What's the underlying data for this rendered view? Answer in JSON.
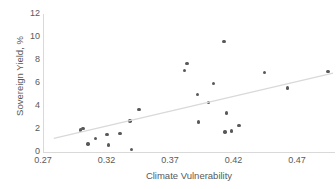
{
  "chart_data": {
    "type": "scatter",
    "title": "",
    "xlabel": "Climate Vulnerability",
    "ylabel": "Sovereign Yield, %",
    "xlim": [
      0.27,
      0.5
    ],
    "ylim": [
      0,
      12
    ],
    "xticks": [
      "0.27",
      "0.32",
      "0.37",
      "0.42",
      "0.47"
    ],
    "xtick_values": [
      0.27,
      0.32,
      0.37,
      0.42,
      0.47
    ],
    "yticks": [
      "0",
      "2",
      "4",
      "6",
      "8",
      "10",
      "12"
    ],
    "ytick_values": [
      0,
      2,
      4,
      6,
      8,
      10,
      12
    ],
    "grid": false,
    "legend": null,
    "marker_color": "#595959",
    "trendline_color": "#d9d9d9",
    "axis_color": "#d9d9d9",
    "text_color": "#595959",
    "points": [
      {
        "x": 0.3015,
        "y": 2.02
      },
      {
        "x": 0.2995,
        "y": 1.9
      },
      {
        "x": 0.3055,
        "y": 0.68
      },
      {
        "x": 0.3115,
        "y": 1.18
      },
      {
        "x": 0.3205,
        "y": 1.5
      },
      {
        "x": 0.3215,
        "y": 0.6
      },
      {
        "x": 0.3305,
        "y": 1.62
      },
      {
        "x": 0.3385,
        "y": 2.7
      },
      {
        "x": 0.3395,
        "y": 0.22
      },
      {
        "x": 0.3455,
        "y": 3.72
      },
      {
        "x": 0.3815,
        "y": 7.08
      },
      {
        "x": 0.3835,
        "y": 7.68
      },
      {
        "x": 0.3915,
        "y": 5.02
      },
      {
        "x": 0.3925,
        "y": 2.62
      },
      {
        "x": 0.4005,
        "y": 4.32
      },
      {
        "x": 0.4045,
        "y": 5.96
      },
      {
        "x": 0.4125,
        "y": 9.62
      },
      {
        "x": 0.4135,
        "y": 1.74
      },
      {
        "x": 0.4145,
        "y": 3.4
      },
      {
        "x": 0.4185,
        "y": 1.82
      },
      {
        "x": 0.4245,
        "y": 2.32
      },
      {
        "x": 0.4445,
        "y": 6.94
      },
      {
        "x": 0.4625,
        "y": 5.58
      },
      {
        "x": 0.4945,
        "y": 7.02
      }
    ],
    "trendline": {
      "type": "linear",
      "x_start": 0.2785,
      "y_start": 1.18,
      "x_end": 0.4985,
      "y_end": 6.86
    }
  }
}
